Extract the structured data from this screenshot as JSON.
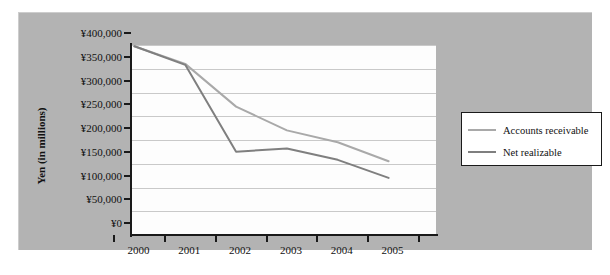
{
  "chart_data": {
    "type": "line",
    "title": "",
    "xlabel": "",
    "ylabel": "Yen (in millions)",
    "categories": [
      "2000",
      "2001",
      "2002",
      "2003",
      "2004",
      "2005"
    ],
    "series": [
      {
        "name": "Accounts receivable",
        "color": "#a9a9a9",
        "values": [
          372000,
          335000,
          245000,
          195000,
          170000,
          130000
        ]
      },
      {
        "name": "Net realizable",
        "color": "#7f7f7f",
        "values": [
          372000,
          333000,
          150000,
          157000,
          133000,
          95000
        ]
      }
    ],
    "ylim": [
      0,
      400000
    ],
    "yticks": [
      0,
      50000,
      100000,
      150000,
      200000,
      250000,
      300000,
      350000,
      400000
    ],
    "ytick_labels": [
      "¥0",
      "¥50,000",
      "¥100,000",
      "¥150,000",
      "¥200,000",
      "¥250,000",
      "¥300,000",
      "¥350,000",
      "¥400,000"
    ],
    "grid": true,
    "legend_position": "right",
    "plot_background": "#fdfdfd",
    "panel_background": "#b3b3b3"
  }
}
